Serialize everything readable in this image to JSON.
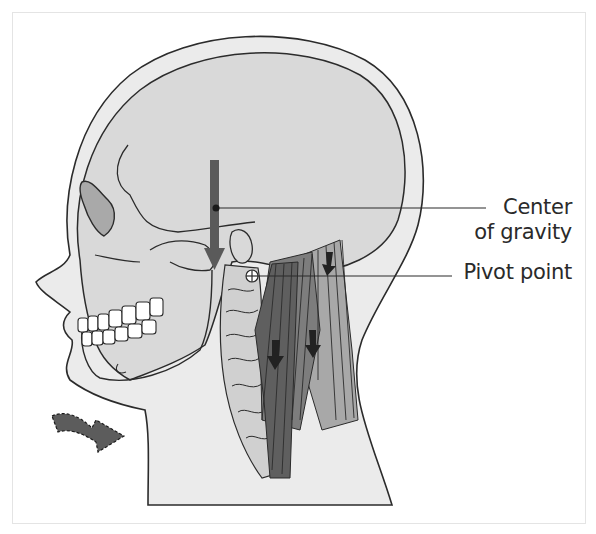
{
  "figure": {
    "labels": {
      "center_of_gravity_line1": "Center",
      "center_of_gravity_line2": "of gravity",
      "pivot_point": "Pivot point"
    },
    "colors": {
      "background": "#ffffff",
      "skin_fill": "#ebebeb",
      "skull_fill": "#d9d9d9",
      "outline": "#2b2b2b",
      "gravity_arrow": "#5a5a5a",
      "muscle_dark": "#5f5f5f",
      "muscle_mid": "#7d7d7d",
      "muscle_light": "#a8a8a8",
      "orbit_fill": "#a9a9a9",
      "rotation_arrow": "#5c5c5c"
    },
    "icons": {
      "gravity_arrow": "arrow-down",
      "pivot_marker": "crosshair-circle",
      "force_arrows": "arrow-down",
      "rotation_arrow": "curved-arrow-right"
    }
  }
}
